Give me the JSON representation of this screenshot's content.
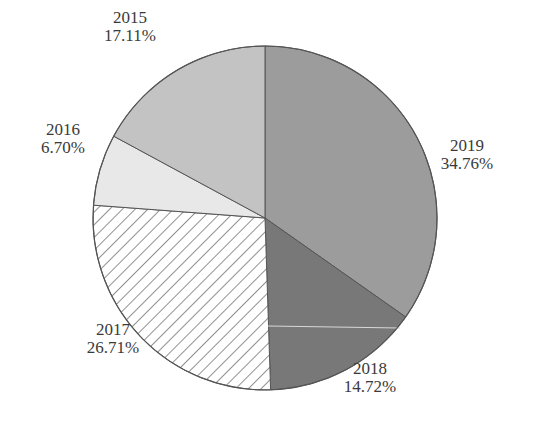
{
  "chart_data": {
    "type": "pie",
    "title": "",
    "start_angle_deg": 0,
    "direction": "clockwise",
    "center": [
      265,
      218
    ],
    "radius": 172,
    "categories": [
      "2019",
      "2018",
      "2017",
      "2016",
      "2015"
    ],
    "values": [
      34.76,
      14.72,
      26.71,
      6.7,
      17.11
    ],
    "unit": "%",
    "slices": [
      {
        "label": "2019",
        "value": 34.76,
        "percent_text": "34.76%",
        "fill": "#9c9c9c",
        "pattern": "solid",
        "label_pos": [
          467,
          155
        ]
      },
      {
        "label": "2018",
        "value": 14.72,
        "percent_text": "14.72%",
        "fill": "#787878",
        "pattern": "solid",
        "label_pos": [
          370,
          378
        ]
      },
      {
        "label": "2017",
        "value": 26.71,
        "percent_text": "26.71%",
        "fill": "#ffffff",
        "pattern": "hatch",
        "label_pos": [
          113,
          339
        ]
      },
      {
        "label": "2016",
        "value": 6.7,
        "percent_text": "6.70%",
        "fill": "#e8e8e8",
        "pattern": "solid",
        "label_pos": [
          63,
          139
        ]
      },
      {
        "label": "2015",
        "value": 17.11,
        "percent_text": "17.11%",
        "fill": "#c3c3c3",
        "pattern": "solid",
        "label_pos": [
          130,
          27
        ]
      }
    ],
    "legend": "none",
    "outline_color": "#555555"
  }
}
